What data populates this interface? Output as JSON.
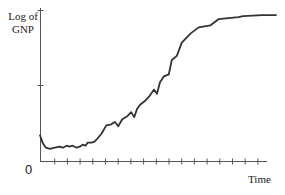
{
  "chart_data": {
    "type": "line",
    "title": "",
    "xlabel": "Time",
    "ylabel": "Log of GNP",
    "ylabel_lines": [
      "Log of",
      "GNP"
    ],
    "origin_label": "0",
    "grid": false,
    "legend": null,
    "x_ticks_count": 18,
    "y_ticks_count": 2,
    "xlim": [
      0,
      100
    ],
    "ylim": [
      0,
      100
    ],
    "series": [
      {
        "name": "Log of GNP",
        "x": [
          0,
          1.3,
          2.6,
          4.3,
          6.5,
          8.7,
          10,
          11.7,
          13,
          14.3,
          16,
          17.4,
          18.7,
          20,
          20.9,
          22.6,
          23.9,
          25.2,
          27,
          29.1,
          31.3,
          32.6,
          33,
          34.3,
          36.1,
          38.3,
          40,
          41.3,
          42.6,
          43.9,
          46.1,
          47.8,
          50,
          51.3,
          52.6,
          54.3,
          56.5,
          57.8,
          60,
          62.2,
          66.1,
          69.6,
          69.6,
          74.8,
          78.3,
          82.6,
          87,
          89.1,
          97.4,
          103.5
        ],
        "y": [
          17,
          11.5,
          8.8,
          8.1,
          8.8,
          9.5,
          8.8,
          10.1,
          9.5,
          10.1,
          8.8,
          9.5,
          10.8,
          10.1,
          12.2,
          12.2,
          12.8,
          14.9,
          18.2,
          23.6,
          24.3,
          25.7,
          25.7,
          23,
          27.7,
          29.7,
          32.4,
          29.1,
          34.5,
          37.2,
          39.9,
          42.6,
          47.3,
          44.6,
          52,
          56,
          57.4,
          66.9,
          69.6,
          78.4,
          84.5,
          88.5,
          88.5,
          89.9,
          93.9,
          94.6,
          95.3,
          95.9,
          96.6,
          96.6
        ]
      }
    ]
  }
}
